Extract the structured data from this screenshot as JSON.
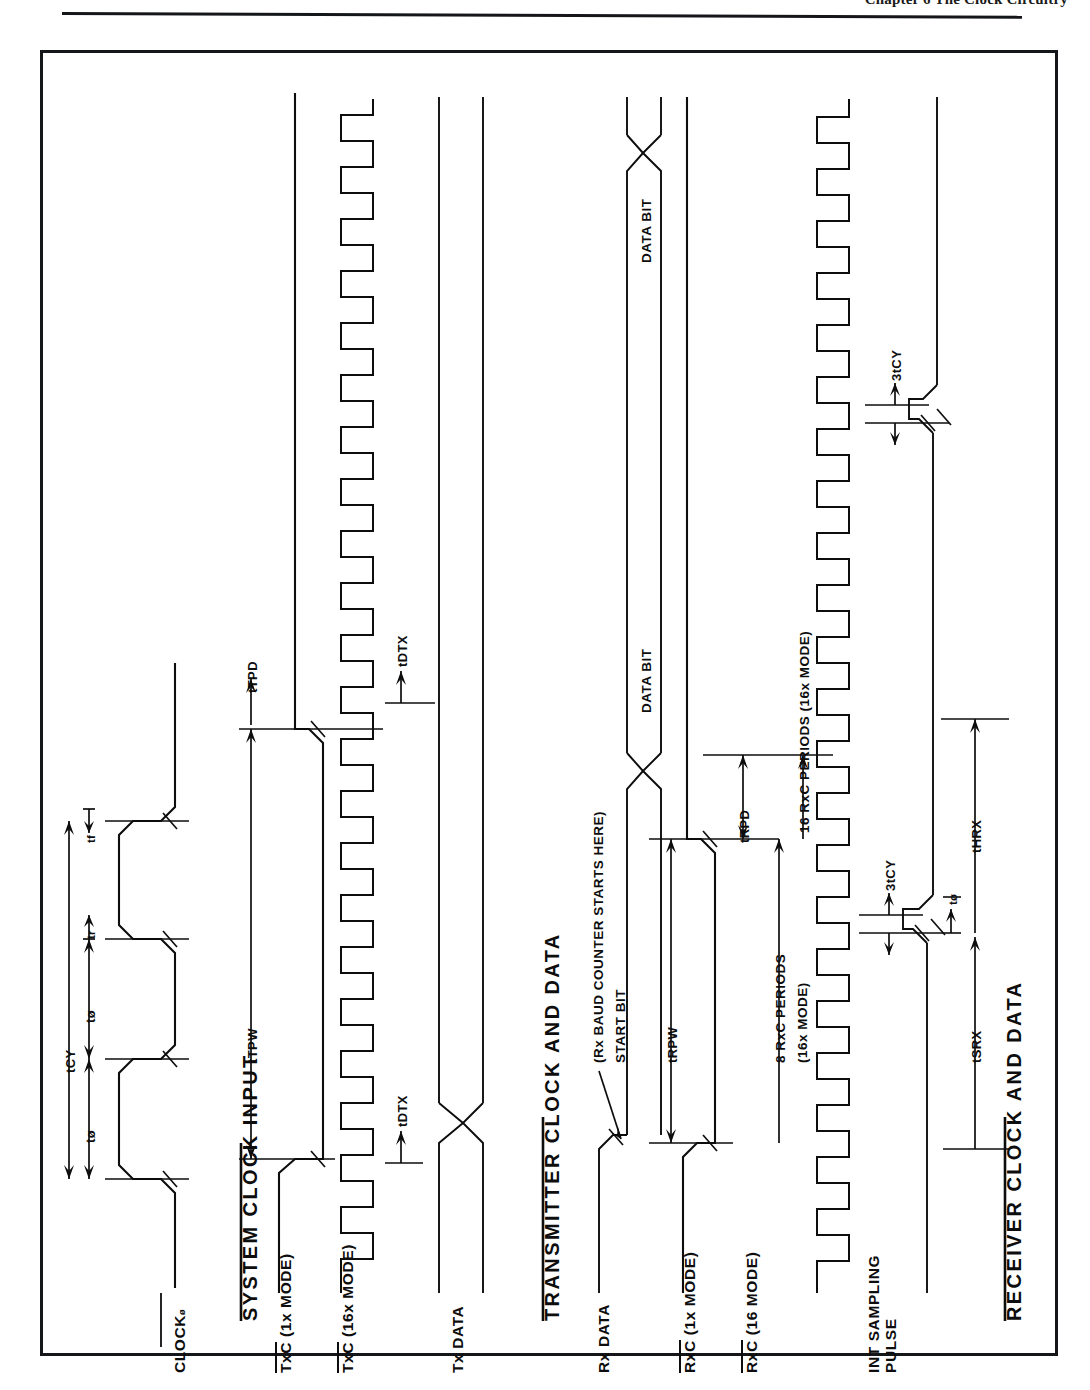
{
  "page": {
    "header_text": "Chapter 6 The Clock Circuitry",
    "header_rule": "horizontal-rule"
  },
  "figure": {
    "orientation": "rotated-90-ccw",
    "type": "timing-waveform-diagram",
    "sections": [
      {
        "id": "system-clock-input",
        "title": "SYSTEM CLOCK INPUT",
        "signals": [
          {
            "name": "CLOCK",
            "suffix": "ø",
            "waveform": "square-clock-3-cycles"
          }
        ],
        "timing_labels": [
          {
            "label": "tCY",
            "meaning": "clock cycle time"
          },
          {
            "label": "tø",
            "meaning": "clock high time"
          },
          {
            "label": "tø",
            "meaning": "clock low time"
          },
          {
            "label": "tr",
            "meaning": "rise time"
          },
          {
            "label": "tf",
            "meaning": "fall time"
          }
        ]
      },
      {
        "id": "transmitter-clock-and-data",
        "title": "TRANSMITTER CLOCK AND DATA",
        "signals": [
          {
            "name": "TxC",
            "mode": "(1x MODE)",
            "overbar": true,
            "waveform": "single-pulse"
          },
          {
            "name": "TxC",
            "mode": "(16x MODE)",
            "overbar": true,
            "waveform": "square-clock-16x"
          },
          {
            "name": "Tx DATA",
            "mode": "",
            "overbar": false,
            "waveform": "data-bus-transition"
          }
        ],
        "timing_labels": [
          {
            "label": "tTPW",
            "meaning": "transmitter clock pulse width"
          },
          {
            "label": "tTPD",
            "meaning": "transmitter clock period"
          },
          {
            "label": "tDTX",
            "meaning": "TxD delay from falling edge of TxC"
          },
          {
            "label": "tDTX",
            "meaning": "TxD delay from falling edge of TxC"
          }
        ]
      },
      {
        "id": "receiver-clock-and-data",
        "title": "RECEIVER CLOCK AND DATA",
        "signals": [
          {
            "name": "Rx DATA",
            "mode": "",
            "overbar": false,
            "waveform": "start-bit-then-data-bits"
          },
          {
            "name": "RxC",
            "mode": "(1x MODE)",
            "overbar": true,
            "waveform": "single-pulse"
          },
          {
            "name": "RxC",
            "mode": "(16 MODE)",
            "overbar": true,
            "waveform": "square-clock-16x"
          },
          {
            "name": "INT SAMPLING PULSE",
            "mode": "",
            "overbar": false,
            "waveform": "sampling-pulse"
          }
        ],
        "annotations": [
          {
            "label": "(Rx BAUD COUNTER STARTS HERE)",
            "kind": "callout-arrow"
          },
          {
            "label": "START BIT",
            "kind": "bit-field"
          },
          {
            "label": "DATA BIT",
            "kind": "bit-field"
          },
          {
            "label": "DATA BIT",
            "kind": "bit-field"
          },
          {
            "label": "8 RxC PERIODS",
            "sub": "(16x MODE)",
            "kind": "span-measure"
          },
          {
            "label": "16 RxC PERIODS (16x MODE)",
            "kind": "span-measure"
          }
        ],
        "timing_labels": [
          {
            "label": "tRPW",
            "meaning": "receiver clock pulse width"
          },
          {
            "label": "tRPD",
            "meaning": "receiver clock period"
          },
          {
            "label": "3tCY",
            "meaning": "three clock cycles"
          },
          {
            "label": "3tCY",
            "meaning": "three clock cycles"
          },
          {
            "label": "tø",
            "meaning": "clock phase"
          },
          {
            "label": "tSRX",
            "meaning": "Rx data setup time"
          },
          {
            "label": "tHRX",
            "meaning": "Rx data hold time"
          }
        ]
      }
    ]
  },
  "colors": {
    "ink": "#0d0d0d",
    "frame": "#15161a",
    "paper": "#ffffff"
  }
}
